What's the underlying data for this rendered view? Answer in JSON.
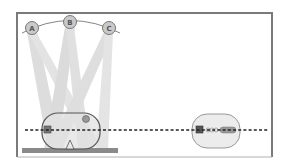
{
  "diagram": {
    "type": "schematic",
    "frame": {
      "x": 17,
      "y": 13,
      "width": 255,
      "height": 144,
      "stroke": "#7a7a7a"
    },
    "sources": [
      {
        "id": "A",
        "label": "A",
        "cx": 32,
        "cy": 28
      },
      {
        "id": "B",
        "label": "B",
        "cx": 70,
        "cy": 22
      },
      {
        "id": "C",
        "label": "C",
        "cx": 109,
        "cy": 28
      }
    ],
    "arc": {
      "description": "arc connecting sources A, B, C"
    },
    "beams": {
      "color": "#cfcfcf",
      "opacity": 0.7
    },
    "left_capsule": {
      "description": "rounded capsule on platform, crossed by beams",
      "fill": "#e4e4e4",
      "stroke": "#555555"
    },
    "right_capsule": {
      "description": "rounded capsule with square, coil and rod components",
      "fill": "#ececec",
      "stroke": "#888888"
    },
    "platform": {
      "color": "#8a8a8a"
    },
    "axis_line": {
      "style": "dashed",
      "color": "#222222",
      "y": 130
    }
  }
}
